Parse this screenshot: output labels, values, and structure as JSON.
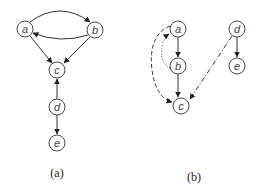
{
  "panels": [
    {
      "caption": "(a)",
      "nodes": [
        {
          "id": "a",
          "label": "a"
        },
        {
          "id": "b",
          "label": "b"
        },
        {
          "id": "c",
          "label": "c"
        },
        {
          "id": "d",
          "label": "d"
        },
        {
          "id": "e",
          "label": "e"
        }
      ],
      "edges": [
        {
          "from": "a",
          "to": "b",
          "style": "solid",
          "curve": "upper"
        },
        {
          "from": "b",
          "to": "a",
          "style": "solid",
          "curve": "lower"
        },
        {
          "from": "a",
          "to": "c",
          "style": "solid"
        },
        {
          "from": "b",
          "to": "c",
          "style": "solid"
        },
        {
          "from": "d",
          "to": "c",
          "style": "solid"
        },
        {
          "from": "d",
          "to": "e",
          "style": "solid"
        }
      ]
    },
    {
      "caption": "(b)",
      "nodes": [
        {
          "id": "a",
          "label": "a"
        },
        {
          "id": "b",
          "label": "b"
        },
        {
          "id": "c",
          "label": "c"
        },
        {
          "id": "d",
          "label": "d"
        },
        {
          "id": "e",
          "label": "e"
        }
      ],
      "edges": [
        {
          "from": "a",
          "to": "b",
          "style": "solid"
        },
        {
          "from": "b",
          "to": "c",
          "style": "solid"
        },
        {
          "from": "d",
          "to": "e",
          "style": "solid"
        },
        {
          "from": "a",
          "to": "c",
          "style": "dashed"
        },
        {
          "from": "b",
          "to": "a",
          "style": "dotted"
        },
        {
          "from": "d",
          "to": "c",
          "style": "dash-dot"
        }
      ]
    }
  ]
}
